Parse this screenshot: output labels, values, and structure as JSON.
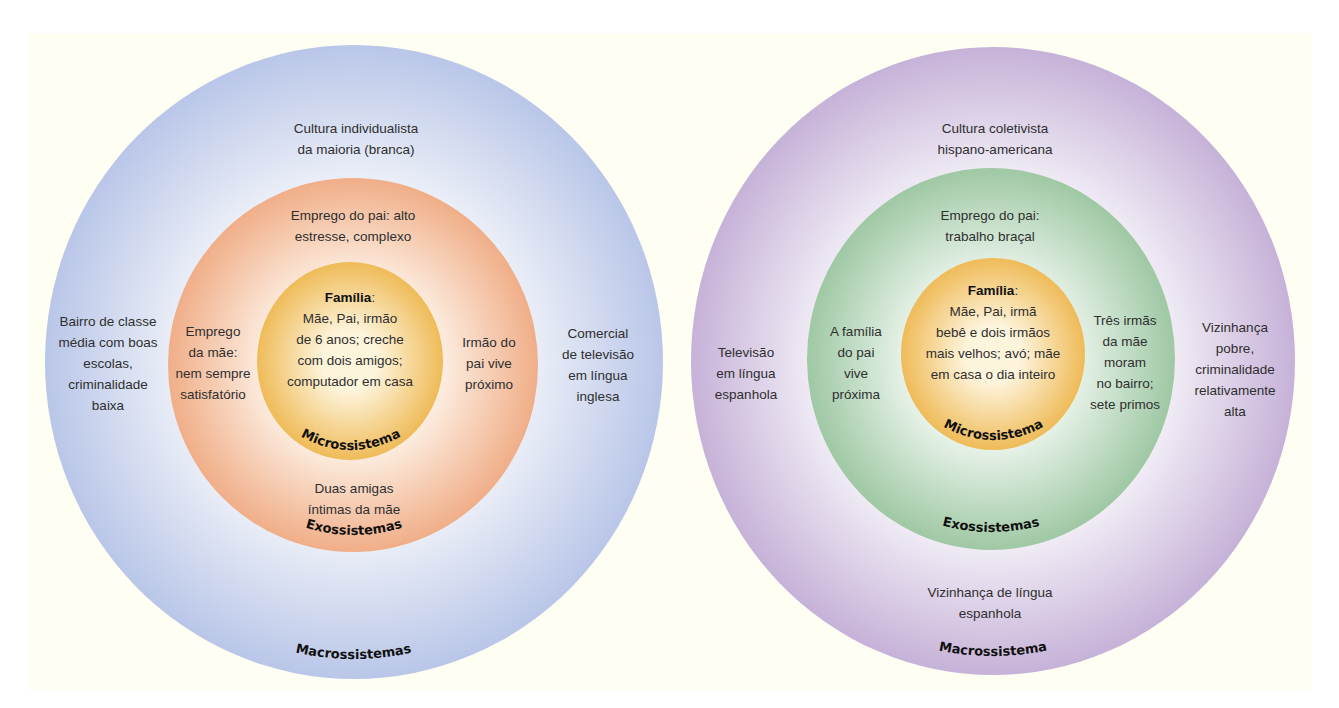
{
  "colors": {
    "paper": "#fefef3",
    "left_outer": "#bcc8e8",
    "left_outer_light": "#eef1f8",
    "left_middle": "#f2b48e",
    "left_middle_light": "#fdf0e4",
    "inner": "#f1bf60",
    "inner_light": "#fdf3d8",
    "right_outer": "#c9b6d9",
    "right_outer_light": "#f4f1f7",
    "right_middle": "#a3cba7",
    "right_middle_light": "#eaf3ea"
  },
  "left_diagram": {
    "macrosystem": {
      "label": "Macrossistemas",
      "top_text": "Cultura individualista\nda maioria (branca)",
      "left_text": "Bairro de classe\nmédia com boas\nescolas,\ncriminalidade\nbaixa",
      "right_text": "Comercial\nde televisão\nem língua\ninglesa"
    },
    "exosystem": {
      "label": "Exossistemas",
      "top_text": "Emprego do pai: alto\nestresse, complexo",
      "left_text": "Emprego\nda mãe:\nnem sempre\nsatisfatório",
      "right_text": "Irmão do\npai vive\npróximo",
      "bottom_text": "Duas amigas\níntimas da mãe"
    },
    "microsystem": {
      "label": "Microssistema",
      "family_title": "Família",
      "family_colon": ":",
      "family_text": "Mãe, Pai, irmão\nde 6 anos; creche\ncom dois amigos;\ncomputador em casa"
    }
  },
  "right_diagram": {
    "macrosystem": {
      "label": "Macrossistema",
      "top_text": "Cultura coletivista\nhispano-americana",
      "left_text": "Televisão\nem língua\nespanhola",
      "right_text": "Vizinhança\npobre,\ncriminalidade\nrelativamente\nalta",
      "bottom_text": "Vizinhança de língua\nespanhola"
    },
    "exosystem": {
      "label": "Exossistemas",
      "top_text": "Emprego do pai:\ntrabalho braçal",
      "left_text": "A família\ndo pai\nvive\npróxima",
      "right_text": "Três irmãs\nda mãe\nmoram\nno bairro;\nsete primos"
    },
    "microsystem": {
      "label": "Microssistema",
      "family_title": "Família",
      "family_colon": ":",
      "family_text": "Mãe, Pai, irmã\nbebê e dois irmãos\nmais velhos; avó; mãe\nem casa o dia inteiro"
    }
  }
}
